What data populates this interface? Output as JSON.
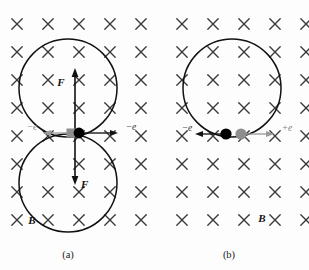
{
  "figure": {
    "background_color": "#fdfdfd",
    "field_symbol": "cross",
    "field_meaning": "magnetic field into the page",
    "cross_color": "#3a3a3a",
    "orbit_color": "#111111"
  },
  "panels": [
    {
      "id": "a",
      "caption": "(a)",
      "field_label": "B",
      "orbits": [
        {
          "name": "upper-orbit",
          "cx": 68,
          "cy": 88,
          "r": 49
        },
        {
          "name": "lower-orbit",
          "cx": 68,
          "cy": 183,
          "r": 49
        }
      ],
      "force_labels": [
        {
          "name": "force-up",
          "text": "F",
          "x": 62,
          "y": 83
        },
        {
          "name": "force-down",
          "text": "F",
          "x": 74,
          "y": 185
        }
      ],
      "particles": [
        {
          "name": "particle-gray-square",
          "shape": "square",
          "color": "#8e8e8e",
          "x": 71,
          "y": 133
        },
        {
          "name": "particle-black-dot",
          "shape": "circle",
          "color": "#000000",
          "x": 79,
          "y": 133
        }
      ],
      "velocity_labels": [
        {
          "name": "velocity-left",
          "text": "−e",
          "direction": "left",
          "color": "#7d7d7d",
          "x": 32,
          "y": 131
        },
        {
          "name": "velocity-right",
          "text": "−e",
          "direction": "right",
          "color": "#2a2a2a",
          "x": 130,
          "y": 131
        }
      ]
    },
    {
      "id": "b",
      "caption": "(b)",
      "field_label": "B",
      "orbits": [
        {
          "name": "orbit",
          "cx": 232,
          "cy": 88,
          "r": 49
        }
      ],
      "force_labels": [],
      "particles": [
        {
          "name": "particle-black-dot",
          "shape": "circle",
          "color": "#000000",
          "x": 226,
          "y": 134
        },
        {
          "name": "particle-gray-dot",
          "shape": "circle",
          "color": "#8e8e8e",
          "x": 240,
          "y": 134
        }
      ],
      "velocity_labels": [
        {
          "name": "velocity-left",
          "text": "−e",
          "direction": "left",
          "color": "#2a2a2a",
          "x": 186,
          "y": 132
        },
        {
          "name": "velocity-right",
          "text": "+e",
          "direction": "right",
          "color": "#7d7d7d",
          "x": 285,
          "y": 132
        }
      ]
    }
  ],
  "field_grid": {
    "rows": 8,
    "cols_per_panel": 5,
    "panel_a_x_start": 17,
    "panel_b_x_start": 182,
    "col_spacing": 31,
    "y_start": 24,
    "row_spacing": 28,
    "cross_size": 5.2
  },
  "labels": {
    "b_label_a": {
      "text": "B",
      "x": 32,
      "y": 223
    },
    "b_label_b": {
      "text": "B",
      "x": 262,
      "y": 221
    },
    "caption_a": {
      "text": "(a)",
      "x": 68,
      "y": 257
    },
    "caption_b": {
      "text": "(b)",
      "x": 229,
      "y": 257
    }
  }
}
